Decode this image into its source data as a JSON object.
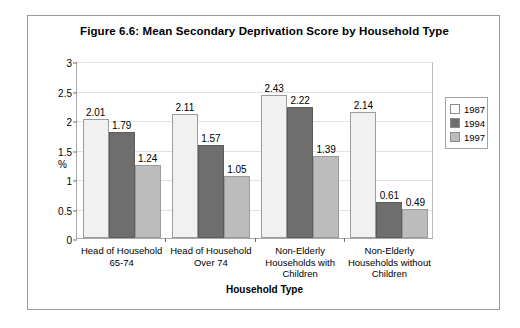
{
  "chart_data": {
    "type": "bar",
    "title": "Figure 6.6: Mean Secondary Deprivation Score by Household Type",
    "xlabel": "Household Type",
    "ylabel": "%",
    "ylim": [
      0,
      3
    ],
    "yticks": [
      "0",
      "0.5",
      "1",
      "1.5",
      "2",
      "2.5",
      "3"
    ],
    "ytick_values": [
      0,
      0.5,
      1,
      1.5,
      2,
      2.5,
      3
    ],
    "grid": true,
    "legend_position": "right",
    "categories": [
      "Head of Household 65-74",
      "Head of Household Over 74",
      "Non-Elderly Households with Children",
      "Non-Elderly Households without Children"
    ],
    "category_lines": [
      [
        "Head of Household",
        "65-74"
      ],
      [
        "Head of Household",
        "Over 74"
      ],
      [
        "Non-Elderly",
        "Households with",
        "Children"
      ],
      [
        "Non-Elderly",
        "Households without",
        "Children"
      ]
    ],
    "series": [
      {
        "name": "1987",
        "color": "#f1f1f1",
        "values": [
          2.01,
          2.11,
          2.43,
          2.14
        ]
      },
      {
        "name": "1994",
        "color": "#6e6e6e",
        "values": [
          1.79,
          1.57,
          2.22,
          0.61
        ]
      },
      {
        "name": "1997",
        "color": "#bcbcbc",
        "values": [
          1.24,
          1.05,
          1.39,
          0.49
        ]
      }
    ],
    "value_labels": [
      [
        "2.01",
        "1.79",
        "1.24"
      ],
      [
        "2.11",
        "1.57",
        "1.05"
      ],
      [
        "2.43",
        "2.22",
        "1.39"
      ],
      [
        "2.14",
        "0.61",
        "0.49"
      ]
    ]
  },
  "legend": {
    "items": [
      {
        "label": "1987",
        "swatch": "legend-swatch-1987"
      },
      {
        "label": "1994",
        "swatch": "legend-swatch-1994"
      },
      {
        "label": "1997",
        "swatch": "legend-swatch-1997"
      }
    ]
  }
}
